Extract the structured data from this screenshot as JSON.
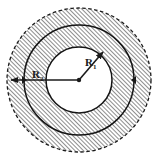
{
  "figure": {
    "kind": "annulus-diagram",
    "background_color": "#ffffff",
    "ink_color": "#1a1a1a",
    "hatch_color": "#4a4a4a",
    "center": {
      "x": 79,
      "y": 80
    },
    "circles": [
      {
        "name": "outer-circle",
        "radius": 72,
        "stroke_style": "dashed",
        "filled": true,
        "fill": "hatched"
      },
      {
        "name": "middle-circle",
        "radius": 55,
        "stroke_style": "solid",
        "filled": false,
        "fill": "hatched"
      },
      {
        "name": "inner-circle",
        "radius": 33,
        "stroke_style": "solid",
        "filled": true,
        "fill": "white"
      }
    ],
    "hatching": {
      "angle_degrees": 45,
      "spacing_px": 3,
      "line_width_px": 1
    },
    "radii": [
      {
        "name": "radius-r1",
        "label": "R",
        "subscript": "1",
        "from": {
          "x": 79,
          "y": 80
        },
        "to": {
          "x": 104,
          "y": 51
        },
        "label_position": {
          "x": 87,
          "y": 64
        },
        "arrowhead": "end",
        "length_px": 33
      },
      {
        "name": "radius-r2",
        "label": "R",
        "subscript": "2",
        "from": {
          "x": 79,
          "y": 80
        },
        "to": {
          "x": 9,
          "y": 80
        },
        "label_position": {
          "x": 36,
          "y": 78
        },
        "arrowhead": "end",
        "length_px": 70
      }
    ],
    "tick_markers": [
      {
        "name": "marker-left",
        "x": 24,
        "y": 80
      },
      {
        "name": "marker-right",
        "x": 134,
        "y": 80
      }
    ],
    "center_dot": {
      "name": "center-point",
      "x": 79,
      "y": 80,
      "radius": 2
    }
  }
}
